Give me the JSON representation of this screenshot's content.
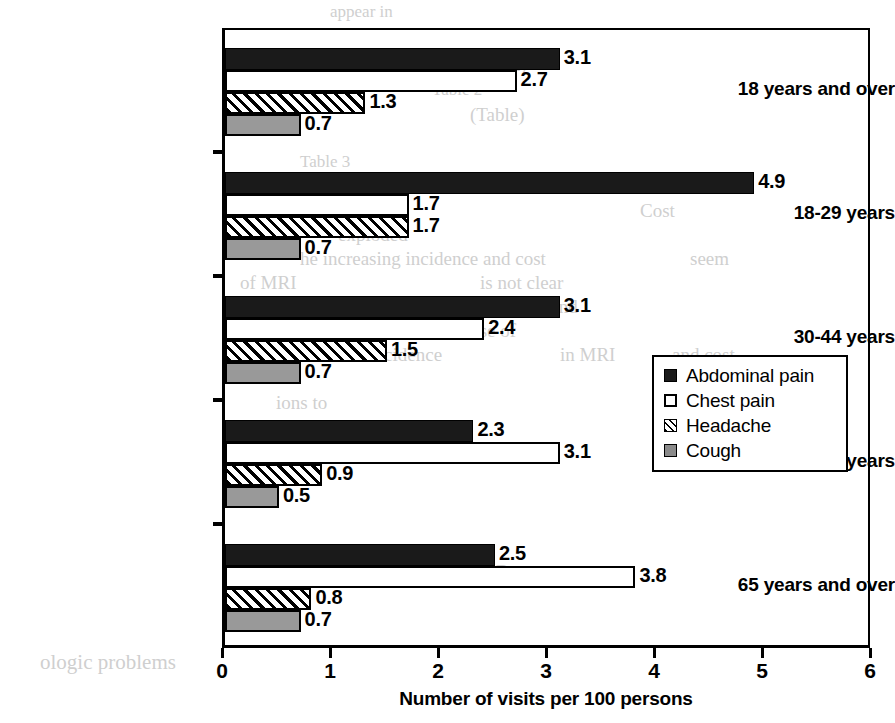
{
  "chart_data": {
    "type": "bar",
    "orientation": "horizontal",
    "title": "",
    "xlabel": "Number of visits per 100 persons",
    "ylabel": "",
    "xlim": [
      0,
      6
    ],
    "xticks": [
      "0",
      "1",
      "2",
      "3",
      "4",
      "5",
      "6"
    ],
    "grid": false,
    "legend_position": "middle-right",
    "categories": [
      "18 years and over",
      "18-29 years",
      "30-44 years",
      "45-64 years",
      "65 years and over"
    ],
    "series": [
      {
        "name": "Abdominal pain",
        "color": "#1a1a1a",
        "fill": "solid-black",
        "values": [
          3.1,
          4.9,
          3.1,
          2.3,
          2.5
        ],
        "labels": [
          "3.1",
          "4.9",
          "3.1",
          "2.3",
          "2.5"
        ]
      },
      {
        "name": "Chest pain",
        "color": "#ffffff",
        "fill": "white-outline",
        "values": [
          2.7,
          1.7,
          2.4,
          3.1,
          3.8
        ],
        "labels": [
          "2.7",
          "1.7",
          "2.4",
          "3.1",
          "3.8"
        ]
      },
      {
        "name": "Headache",
        "color": "#ffffff",
        "fill": "diagonal-hatch",
        "values": [
          1.3,
          1.7,
          1.5,
          0.9,
          0.8
        ],
        "labels": [
          "1.3",
          "1.7",
          "1.5",
          "0.9",
          "0.8"
        ]
      },
      {
        "name": "Cough",
        "color": "#999999",
        "fill": "solid-gray",
        "values": [
          0.7,
          0.7,
          0.7,
          0.5,
          0.7
        ],
        "labels": [
          "0.7",
          "0.7",
          "0.7",
          "0.5",
          "0.7"
        ]
      }
    ]
  },
  "background_text": [
    {
      "text": "appear in",
      "x": 330,
      "y": 2,
      "size": 17
    },
    {
      "text": "(12)",
      "x": 498,
      "y": 56,
      "size": 17
    },
    {
      "text": "Table 2",
      "x": 432,
      "y": 80,
      "size": 17
    },
    {
      "text": "(Table)",
      "x": 470,
      "y": 104,
      "size": 19
    },
    {
      "text": "Table 3",
      "x": 300,
      "y": 152,
      "size": 17
    },
    {
      "text": "ns will result",
      "x": 418,
      "y": 176,
      "size": 19
    },
    {
      "text": "in the",
      "x": 560,
      "y": 176,
      "size": 19
    },
    {
      "text": "as will reduce",
      "x": 230,
      "y": 200,
      "size": 19
    },
    {
      "text": "Cost",
      "x": 640,
      "y": 200,
      "size": 19
    },
    {
      "text": "exploded",
      "x": 338,
      "y": 224,
      "size": 19
    },
    {
      "text": "he increasing incidence and cost",
      "x": 300,
      "y": 248,
      "size": 19
    },
    {
      "text": "seem",
      "x": 690,
      "y": 248,
      "size": 19
    },
    {
      "text": "of MRI",
      "x": 240,
      "y": 272,
      "size": 19
    },
    {
      "text": "is not clear",
      "x": 480,
      "y": 272,
      "size": 19
    },
    {
      "text": "of MRI",
      "x": 260,
      "y": 296,
      "size": 19
    },
    {
      "text": "prognosis (Table 4) and",
      "x": 398,
      "y": 296,
      "size": 19
    },
    {
      "text": "and the use of",
      "x": 410,
      "y": 320,
      "size": 19
    },
    {
      "text": "reased incidence",
      "x": 316,
      "y": 344,
      "size": 19
    },
    {
      "text": "in MRI",
      "x": 560,
      "y": 344,
      "size": 19
    },
    {
      "text": "and cost",
      "x": 672,
      "y": 344,
      "size": 19
    },
    {
      "text": "ions to",
      "x": 276,
      "y": 392,
      "size": 19
    },
    {
      "text": "of the study",
      "x": 400,
      "y": 440,
      "size": 19
    },
    {
      "text": "Therapeutic Process",
      "x": 380,
      "y": 560,
      "size": 23
    },
    {
      "text": "ologic problems",
      "x": 40,
      "y": 650,
      "size": 21
    }
  ]
}
